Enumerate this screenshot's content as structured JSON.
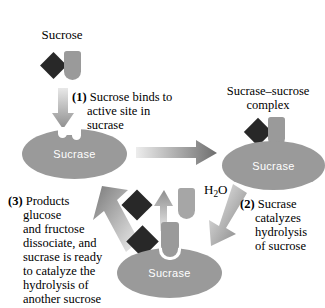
{
  "diagram": {
    "substrate_label": "Sucrose",
    "complex_label_line1": "Sucrase–sucrose",
    "complex_label_line2": "complex",
    "water_label_text": "H",
    "water_label_sub": "2",
    "water_label_tail": "O",
    "enzyme_label": "Sucrase",
    "steps": [
      {
        "number": "(1)",
        "text": "Sucrose binds to active site in sucrase",
        "lines": [
          "Sucrose binds to",
          "active site in",
          "sucrase"
        ]
      },
      {
        "number": "(2)",
        "text": "Sucrase catalyzes hydrolysis of sucrose",
        "lines": [
          "Sucrase",
          "catalyzes",
          "hydrolysis",
          "of sucrose"
        ]
      },
      {
        "number": "(3)",
        "text": "Products glucose and fructose dissociate, and sucrase is ready to catalyze the hydrolysis of another sucrose",
        "lines": [
          "Products",
          "glucose",
          "and fructose",
          "dissociate, and",
          "sucrase is ready",
          "to catalyze the",
          "hydrolysis of",
          "another sucrose"
        ]
      }
    ],
    "enzymes": [
      {
        "id": "free-enzyme-top-left",
        "label": "Sucrase"
      },
      {
        "id": "enzyme-substrate-complex-top-right",
        "label": "Sucrase"
      },
      {
        "id": "enzyme-products-bottom",
        "label": "Sucrase"
      }
    ],
    "colors": {
      "enzyme": "#9a9a9a",
      "glucose": "#282828",
      "fructose": "#9a9a9a",
      "arrow_dark": "#6e6e6e",
      "arrow_light": "#e4e4e4",
      "text": "#000000",
      "enzyme_text": "#ffffff",
      "background": "#ffffff"
    }
  }
}
